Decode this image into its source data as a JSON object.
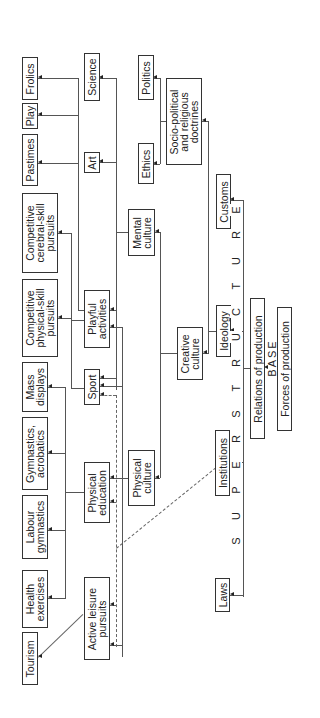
{
  "diagram": {
    "orientation": "rotated 90 degrees counter-clockwise",
    "layers": {
      "superstructure_label": "S U P E R S T R U C T U R E",
      "superstructure_letters": [
        "S",
        "U",
        "P",
        "E",
        "R",
        "S",
        "T",
        "R",
        "U",
        "C",
        "T",
        "U",
        "R",
        "E"
      ],
      "base_label": "BASE"
    },
    "nodes": {
      "frolics": "Frolics",
      "play": "Play",
      "pastimes": "Pastimes",
      "cerebral": "Competitive\ncerebral-skill\npursuits",
      "physical_skill": "Competitive\nphysical-skill\npursuits",
      "mass_displays": "Mass\ndisplays",
      "gymnastics": "Gymnastics,\nacrobatics",
      "labour": "Labour\ngymnastics",
      "health": "Health\nexercises",
      "tourism": "Tourism",
      "science": "Science",
      "art": "Art",
      "playful": "Playful\nactivities",
      "sport": "Sport",
      "phys_ed": "Physical\neducation",
      "active_leisure": "Active leisure\npursuits",
      "politics": "Politics",
      "ethics": "Ethics",
      "mental": "Mental\nculture",
      "physical_culture": "Physical\nculture",
      "sociopolitical": "Socio-political\nand religious\ndoctrines",
      "creative": "Creative\nculture",
      "customs": "Customs",
      "ideology": "Ideology",
      "institutions": "Institutions",
      "laws": "Laws",
      "relations": "Relations of production",
      "forces": "Forces of production"
    },
    "edges": [
      [
        "Forces of production",
        "Relations of production"
      ],
      [
        "Relations of production",
        "Superstructure"
      ],
      [
        "Superstructure",
        "Customs"
      ],
      [
        "Superstructure",
        "Ideology"
      ],
      [
        "Superstructure",
        "Institutions"
      ],
      [
        "Superstructure",
        "Laws"
      ],
      [
        "Ideology",
        "Socio-political and religious doctrines"
      ],
      [
        "Ideology",
        "Creative culture"
      ],
      [
        "Socio-political and religious doctrines",
        "Politics"
      ],
      [
        "Socio-political and religious doctrines",
        "Ethics"
      ],
      [
        "Creative culture",
        "Mental culture"
      ],
      [
        "Creative culture",
        "Physical culture"
      ],
      [
        "Mental culture",
        "Science"
      ],
      [
        "Mental culture",
        "Art"
      ],
      [
        "Mental culture",
        "Playful activities"
      ],
      [
        "Mental culture",
        "Sport"
      ],
      [
        "Physical culture",
        "Sport"
      ],
      [
        "Physical culture",
        "Physical education"
      ],
      [
        "Physical culture",
        "Active leisure pursuits"
      ],
      [
        "Playful activities",
        "Frolics"
      ],
      [
        "Playful activities",
        "Play"
      ],
      [
        "Playful activities",
        "Pastimes"
      ],
      [
        "Playful activities",
        "Competitive cerebral-skill pursuits"
      ],
      [
        "Sport",
        "Competitive physical-skill pursuits"
      ],
      [
        "Physical education",
        "Mass displays"
      ],
      [
        "Physical education",
        "Gymnastics, acrobatics"
      ],
      [
        "Physical education",
        "Labour gymnastics"
      ],
      [
        "Physical education",
        "Health exercises"
      ],
      [
        "Active leisure pursuits",
        "Tourism"
      ],
      [
        "Institutions",
        "Sport / Physical education / Active leisure pursuits (dashed)"
      ]
    ]
  }
}
